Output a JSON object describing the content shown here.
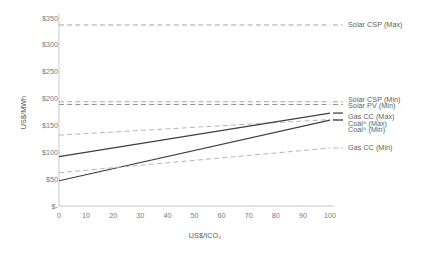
{
  "chart_data": {
    "type": "line",
    "title": "",
    "xlabel": "US$/tCO₂",
    "ylabel": "US$/MWh",
    "xlim": [
      0,
      100
    ],
    "ylim": [
      0,
      350
    ],
    "xticks": [
      0,
      10,
      20,
      30,
      40,
      50,
      60,
      70,
      80,
      90,
      100
    ],
    "xtick_labels": [
      "0",
      "10",
      "20",
      "30",
      "40",
      "50",
      "60",
      "70",
      "80",
      "90",
      "100"
    ],
    "yticks": [
      0,
      50,
      100,
      150,
      200,
      250,
      300,
      350
    ],
    "ytick_labels": [
      "$-",
      "$50",
      "$100",
      "$150",
      "$200",
      "$250",
      "$300",
      "$350"
    ],
    "grid": false,
    "legend_position": "right",
    "series": [
      {
        "name": "Solar CSP (Max)",
        "x": [
          0,
          100
        ],
        "values": [
          337,
          337
        ],
        "style": "dashed",
        "color": "#a6a6a6",
        "label_y": 337
      },
      {
        "name": "Solar CSP (Min)",
        "x": [
          0,
          100
        ],
        "values": [
          194,
          194
        ],
        "style": "dashed",
        "color": "#a6a6a6",
        "label_y": 198
      },
      {
        "name": "Solar PV (Min)",
        "x": [
          0,
          100
        ],
        "values": [
          189,
          189
        ],
        "style": "dashed",
        "color": "#8f8f8f",
        "label_y": 187
      },
      {
        "name": "Gas CC (Max)",
        "x": [
          0,
          100
        ],
        "values": [
          132,
          161
        ],
        "style": "dashed",
        "color": "#b5b5b5",
        "label_y": 166
      },
      {
        "name": "Coal^ (Max)",
        "x": [
          0,
          100
        ],
        "values": [
          92,
          173
        ],
        "style": "solid",
        "color": "#3f3f3f",
        "label_y": 153
      },
      {
        "name": "Coal^ (Min)",
        "x": [
          0,
          100
        ],
        "values": [
          47,
          160
        ],
        "style": "solid",
        "color": "#3f3f3f",
        "label_y": 141
      },
      {
        "name": "Gas CC (Min)",
        "x": [
          0,
          100
        ],
        "values": [
          62,
          108
        ],
        "style": "dashed",
        "color": "#b5b5b5",
        "label_y": 108
      }
    ]
  },
  "axes": {
    "y_title": "US$/MWh",
    "x_title": "US$/tCO₂",
    "y_tick_labels": [
      "$350",
      "$300",
      "$250",
      "$200",
      "$150",
      "$100",
      "$50",
      "$-"
    ],
    "x_tick_labels": [
      "0",
      "10",
      "20",
      "30",
      "40",
      "50",
      "60",
      "70",
      "80",
      "90",
      "100"
    ]
  },
  "legend": {
    "entries": [
      {
        "label": "Solar CSP (Max)"
      },
      {
        "label": "Solar CSP (Min)"
      },
      {
        "label": "Solar PV (Min)"
      },
      {
        "label": "Gas CC (Max)"
      },
      {
        "label": "Coal^ (Max)"
      },
      {
        "label": "Coal^ (Min)"
      },
      {
        "label": "Gas CC (Min)"
      }
    ]
  },
  "colors": {
    "axis_line": "#bfbfbf",
    "tick_text": "#7a7a7a",
    "solid_line": "#3f3f3f",
    "dashed_line": "#a6a6a6",
    "background": "#ffffff"
  }
}
